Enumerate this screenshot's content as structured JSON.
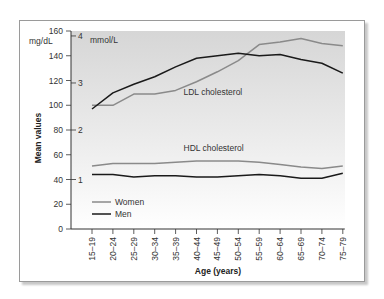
{
  "chart_data": {
    "type": "line",
    "title": "",
    "xlabel": "Age (years)",
    "ylabel": "Mean values",
    "ylim": [
      0,
      160
    ],
    "y_ticks": [
      0,
      20,
      40,
      60,
      80,
      100,
      120,
      140,
      160
    ],
    "y_unit_primary": "mg/dL",
    "y_unit_secondary": "mmol/L",
    "y_secondary_ticks": [
      {
        "label": "1",
        "value_mgdl": 40
      },
      {
        "label": "2",
        "value_mgdl": 80
      },
      {
        "label": "3",
        "value_mgdl": 118
      },
      {
        "label": "4",
        "value_mgdl": 156
      }
    ],
    "categories": [
      "15–19",
      "20–24",
      "25–29",
      "30–34",
      "35–39",
      "40–44",
      "45–49",
      "50–54",
      "55–59",
      "60–64",
      "65–69",
      "70–74",
      "75–79"
    ],
    "series": [
      {
        "name": "Women",
        "group": "LDL cholesterol",
        "color": "#8a8a8a",
        "values": [
          100,
          100,
          109,
          109,
          112,
          119,
          127,
          136,
          149,
          151,
          154,
          150,
          148
        ]
      },
      {
        "name": "Men",
        "group": "LDL cholesterol",
        "color": "#1a1a1a",
        "values": [
          97,
          110,
          117,
          123,
          131,
          138,
          140,
          142,
          140,
          141,
          137,
          134,
          126
        ]
      },
      {
        "name": "Women",
        "group": "HDL cholesterol",
        "color": "#8a8a8a",
        "values": [
          51,
          53,
          53,
          53,
          54,
          55,
          55,
          55,
          54,
          52,
          50,
          49,
          51
        ]
      },
      {
        "name": "Men",
        "group": "HDL cholesterol",
        "color": "#1a1a1a",
        "values": [
          44,
          44,
          42,
          43,
          43,
          42,
          42,
          43,
          44,
          43,
          41,
          41,
          45
        ]
      }
    ],
    "annotations": [
      {
        "text": "LDL cholesterol",
        "x_category": "40–44",
        "y": 108
      },
      {
        "text": "HDL cholesterol",
        "x_category": "40–44",
        "y": 63
      }
    ],
    "legend": {
      "position": "lower-left-inside",
      "entries": [
        {
          "label": "Women",
          "color": "#8a8a8a"
        },
        {
          "label": "Men",
          "color": "#1a1a1a"
        }
      ]
    },
    "grid": false
  }
}
